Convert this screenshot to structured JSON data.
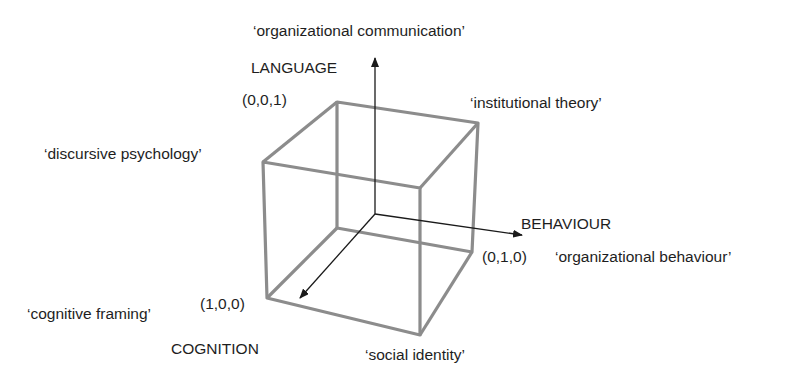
{
  "axes": {
    "language": {
      "label": "LANGUAGE",
      "coord": "(0,0,1)",
      "theory": "‘organizational communication’"
    },
    "behaviour": {
      "label": "BEHAVIOUR",
      "coord": "(0,1,0)",
      "theory": "‘organizational behaviour’"
    },
    "cognition": {
      "label": "COGNITION",
      "coord": "(1,0,0)",
      "theory": "‘cognitive framing’"
    }
  },
  "vertex_labels": {
    "institutional": "‘institutional theory’",
    "discursive": "‘discursive psychology’",
    "social": "‘social identity’"
  },
  "colors": {
    "cube_edge": "#8c8c8c",
    "axis": "#1a1a1a",
    "text": "#1e1e1e"
  }
}
